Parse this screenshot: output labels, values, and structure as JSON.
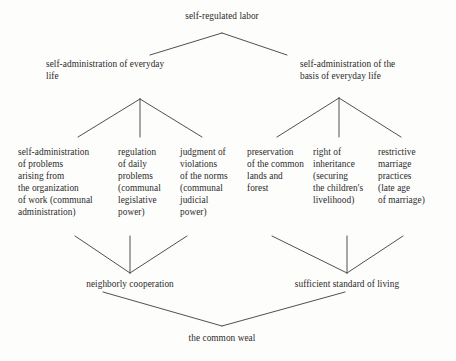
{
  "diagram": {
    "type": "hierarchy-tree",
    "title_node": {
      "id": "root",
      "label": "self-regulated labor"
    },
    "level2": [
      {
        "id": "l2-left",
        "label": "self-administration of everyday\nlife"
      },
      {
        "id": "l2-right",
        "label": "self-administration of the\nbasis of everyday life"
      }
    ],
    "leaves": [
      {
        "id": "leaf-1",
        "label": "self-administration\nof problems\narising from\nthe organization\nof work (communal\nadministration)"
      },
      {
        "id": "leaf-2",
        "label": "regulation\nof daily\nproblems\n(communal\nlegislative\npower)"
      },
      {
        "id": "leaf-3",
        "label": "judgment of\nviolations\nof the norms\n(communal\njudicial\npower)"
      },
      {
        "id": "leaf-4",
        "label": "preservation\nof the common\nlands and\nforest"
      },
      {
        "id": "leaf-5",
        "label": "right of\ninheritance\n(securing\nthe children's\nlivelihood)"
      },
      {
        "id": "leaf-6",
        "label": "restrictive\nmarriage\npractices\n(late age\nof marriage)"
      }
    ],
    "synthesis": [
      {
        "id": "syn-left",
        "label": "neighborly cooperation"
      },
      {
        "id": "syn-right",
        "label": "sufficient standard of living"
      }
    ],
    "conclusion": {
      "id": "conclusion",
      "label": "the common weal"
    },
    "colors": {
      "background": "#fdfdfb",
      "text": "#2b2b2b",
      "line": "#3c3c3c"
    }
  }
}
